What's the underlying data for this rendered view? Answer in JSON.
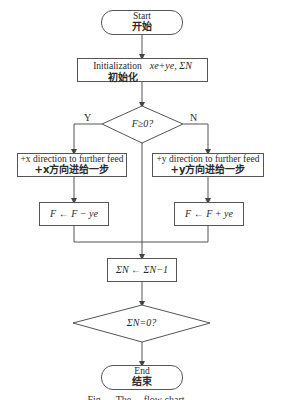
{
  "diagram": {
    "type": "flowchart",
    "nodes": {
      "start": {
        "en": "Start",
        "zh": "开始"
      },
      "init": {
        "en": "Initialization",
        "math": "xe+ye, ΣN",
        "zh": "初始化"
      },
      "decision1": {
        "text": "F≥0?"
      },
      "plus_x": {
        "en": "+x direction to further feed",
        "zh": "+x方向进给一步"
      },
      "plus_y": {
        "en": "+y direction to further feed",
        "zh": "+y方向进给一步"
      },
      "f_minus": {
        "text": "F ← F − ye"
      },
      "f_plus": {
        "text": "F ← F + ye"
      },
      "sum_dec": {
        "text": "ΣN ← ΣN−1"
      },
      "decision2": {
        "text": "ΣN=0?"
      },
      "end": {
        "en": "End",
        "zh": "结束"
      }
    },
    "branch_labels": {
      "yes": "Y",
      "no": "N"
    },
    "edges": [
      [
        "start",
        "init"
      ],
      [
        "init",
        "decision1"
      ],
      [
        "decision1",
        "plus_x",
        "Y"
      ],
      [
        "decision1",
        "plus_y",
        "N"
      ],
      [
        "plus_x",
        "f_minus"
      ],
      [
        "plus_y",
        "f_plus"
      ],
      [
        "f_minus",
        "sum_dec"
      ],
      [
        "f_plus",
        "sum_dec"
      ],
      [
        "decision1",
        "sum_dec"
      ],
      [
        "sum_dec",
        "decision2"
      ],
      [
        "decision2",
        "end"
      ]
    ],
    "caption": "Fig. ... The ... flow chart ..."
  }
}
